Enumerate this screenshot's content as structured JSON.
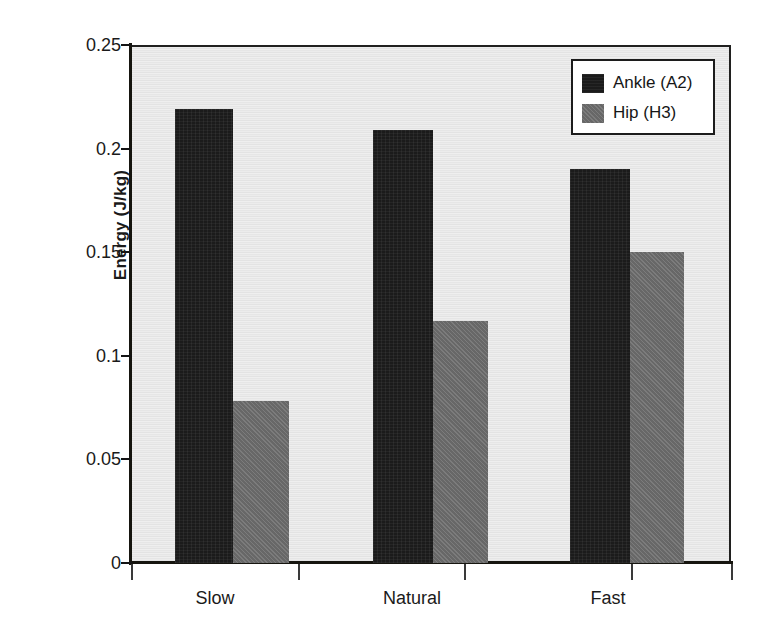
{
  "chart_data": {
    "type": "bar",
    "title": "",
    "xlabel": "",
    "ylabel": "Energy (J/kg)",
    "categories": [
      "Slow",
      "Natural",
      "Fast"
    ],
    "series": [
      {
        "name": "Ankle (A2)",
        "color": "#1b1b1b",
        "values": [
          0.219,
          0.209,
          0.19
        ]
      },
      {
        "name": "Hip (H3)",
        "color": "#6d6d6d",
        "values": [
          0.078,
          0.117,
          0.15
        ]
      }
    ],
    "ylim": [
      0,
      0.25
    ],
    "yticks": [
      0,
      0.05,
      0.1,
      0.15,
      0.2,
      0.25
    ],
    "ytick_labels": [
      "0",
      "0.05",
      "0.1",
      "0.15",
      "0.2",
      "0.25"
    ],
    "grid": false,
    "legend_position": "top-right",
    "plot_background": "#e9e9e9",
    "axis_color": "#16150f"
  }
}
